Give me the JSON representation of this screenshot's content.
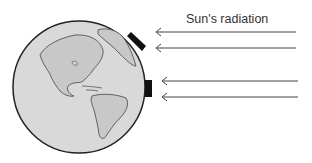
{
  "diagram": {
    "label": "Sun's radiation",
    "globe": {
      "cx": 79,
      "cy": 87,
      "r": 66,
      "fill": "#d9d9d9",
      "stroke": "#222222"
    },
    "arrows": [
      {
        "y": 32,
        "x1": 296,
        "x2": 155
      },
      {
        "y": 48,
        "x1": 296,
        "x2": 155
      },
      {
        "y": 81,
        "x1": 298,
        "x2": 161
      },
      {
        "y": 97,
        "x1": 298,
        "x2": 161
      }
    ],
    "panels": [
      {
        "name": "tilted-panel",
        "x1": 128,
        "y1": 34,
        "x2": 143,
        "y2": 50
      },
      {
        "name": "vertical-panel",
        "x": 146,
        "y": 80,
        "w": 6,
        "h": 17
      }
    ]
  }
}
